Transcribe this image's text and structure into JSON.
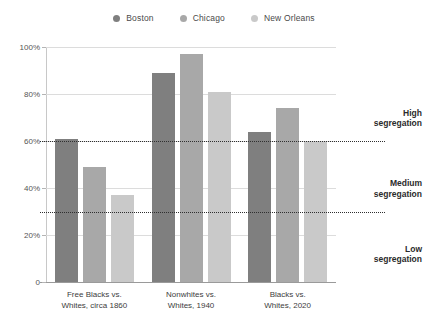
{
  "chart_data": {
    "type": "bar",
    "title": "",
    "xlabel": "",
    "ylabel": "",
    "ylim": [
      0,
      100
    ],
    "grid": true,
    "legend_position": "top-center",
    "categories": [
      "Free Blacks vs.\nWhites, circa 1860",
      "Nonwhites vs.\nWhites, 1940",
      "Blacks vs.\nWhites, 2020"
    ],
    "series": [
      {
        "name": "Boston",
        "color": "#7f7f7f",
        "values": [
          61,
          89,
          64
        ]
      },
      {
        "name": "Chicago",
        "color": "#a8a8a8",
        "values": [
          49,
          97,
          74
        ]
      },
      {
        "name": "New Orleans",
        "color": "#c9c9c9",
        "values": [
          37,
          81,
          60
        ]
      }
    ],
    "y_ticks": [
      {
        "value": 100,
        "label": "100%"
      },
      {
        "value": 80,
        "label": "80%"
      },
      {
        "value": 60,
        "label": "60%"
      },
      {
        "value": 40,
        "label": "40%"
      },
      {
        "value": 20,
        "label": "20%"
      },
      {
        "value": 0,
        "label": "0"
      }
    ],
    "thresholds": [
      {
        "value": 60,
        "label": "High\nsegregation",
        "label_y": 48
      },
      {
        "value": 30,
        "label": "Medium\nsegregation",
        "label_y": 27
      }
    ],
    "annotations": [
      {
        "label": "High\nsegregation",
        "at": 70
      },
      {
        "label": "Medium\nsegregation",
        "at": 40
      },
      {
        "label": "Low\nsegregation",
        "at": 12
      }
    ]
  }
}
